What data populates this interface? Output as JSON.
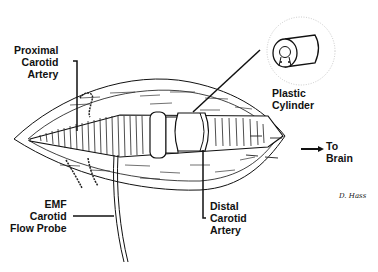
{
  "diagram": {
    "type": "surgical-illustration",
    "labels": {
      "proximal_carotid": {
        "line1": "Proximal",
        "line2": "Carotid",
        "line3": "Artery"
      },
      "plastic_cylinder": {
        "line1": "Plastic",
        "line2": "Cylinder"
      },
      "to_brain": {
        "line1": "To",
        "line2": "Brain"
      },
      "emf_probe": {
        "line1": "EMF",
        "line2": "Carotid",
        "line3": "Flow Probe"
      },
      "distal_carotid": {
        "line1": "Distal",
        "line2": "Carotid",
        "line3": "Artery"
      }
    },
    "signature": "D. Hass",
    "colors": {
      "ink": "#111111",
      "background": "#ffffff",
      "inset_circle": "#bbbbbb"
    }
  }
}
